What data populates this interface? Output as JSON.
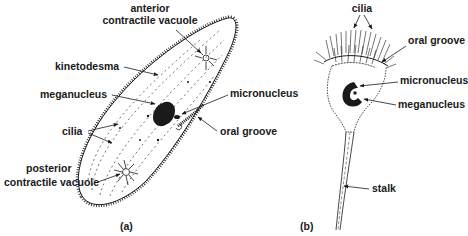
{
  "figure": {
    "panel_a": {
      "caption": "(a)",
      "organism": "paramecium",
      "labels": {
        "anterior_line1": "anterior",
        "anterior_line2": "contractile vacuole",
        "kinetodesma": "kinetodesma",
        "meganucleus": "meganucleus",
        "micronucleus": "micronucleus",
        "cilia": "cilia",
        "oral_groove": "oral groove",
        "posterior_line1": "posterior",
        "posterior_line2": "contractile vacuole"
      }
    },
    "panel_b": {
      "caption": "(b)",
      "organism": "vorticella",
      "labels": {
        "cilia": "cilia",
        "oral_groove": "oral groove",
        "micronucleus": "micronucleus",
        "meganucleus": "meganucleus",
        "stalk": "stalk"
      }
    },
    "colors": {
      "ink": "#1a1a1a",
      "background": "#ffffff"
    }
  }
}
